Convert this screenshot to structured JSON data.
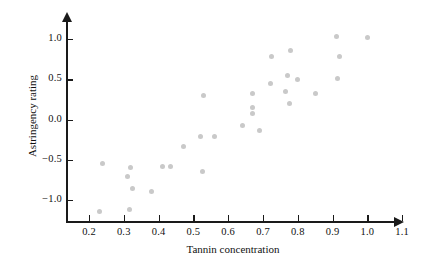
{
  "chart_data": {
    "type": "scatter",
    "title": "",
    "xlabel": "Tannin concentration",
    "ylabel": "Astringency rating",
    "xlim": [
      0.155,
      1.16
    ],
    "ylim": [
      -1.22,
      1.12
    ],
    "grid": false,
    "legend": null,
    "xticks": [
      0.2,
      0.3,
      0.4,
      0.5,
      0.6,
      0.7,
      0.8,
      0.9,
      1.0,
      1.1
    ],
    "xticklabels": [
      "0.2",
      "0.3",
      "0.4",
      "0.5",
      "0.6",
      "0.7",
      "0.8",
      "0.9",
      "1.0",
      "1.1"
    ],
    "yticks": [
      -1.0,
      -0.5,
      0.0,
      0.5,
      1.0
    ],
    "yticklabels": [
      "−1.0",
      "−0.5",
      "0.0",
      "0.5",
      "1.0"
    ],
    "marker": {
      "shape": "circle",
      "color": "#c9c9c9",
      "size": 5
    },
    "points": [
      {
        "x": 0.23,
        "y": -1.14
      },
      {
        "x": 0.24,
        "y": -0.55
      },
      {
        "x": 0.31,
        "y": -0.71
      },
      {
        "x": 0.315,
        "y": -1.12
      },
      {
        "x": 0.32,
        "y": -0.6
      },
      {
        "x": 0.325,
        "y": -0.86
      },
      {
        "x": 0.38,
        "y": -0.9
      },
      {
        "x": 0.41,
        "y": -0.58
      },
      {
        "x": 0.435,
        "y": -0.58
      },
      {
        "x": 0.47,
        "y": -0.33
      },
      {
        "x": 0.52,
        "y": -0.21
      },
      {
        "x": 0.525,
        "y": -0.64
      },
      {
        "x": 0.53,
        "y": 0.3
      },
      {
        "x": 0.56,
        "y": -0.21
      },
      {
        "x": 0.64,
        "y": -0.08
      },
      {
        "x": 0.67,
        "y": 0.33
      },
      {
        "x": 0.67,
        "y": 0.15
      },
      {
        "x": 0.67,
        "y": 0.08
      },
      {
        "x": 0.69,
        "y": -0.14
      },
      {
        "x": 0.72,
        "y": 0.45
      },
      {
        "x": 0.725,
        "y": 0.79
      },
      {
        "x": 0.765,
        "y": 0.35
      },
      {
        "x": 0.77,
        "y": 0.55
      },
      {
        "x": 0.775,
        "y": 0.2
      },
      {
        "x": 0.78,
        "y": 0.86
      },
      {
        "x": 0.8,
        "y": 0.5
      },
      {
        "x": 0.85,
        "y": 0.32
      },
      {
        "x": 0.91,
        "y": 1.03
      },
      {
        "x": 0.915,
        "y": 0.51
      },
      {
        "x": 0.92,
        "y": 0.79
      },
      {
        "x": 1.0,
        "y": 1.02
      }
    ]
  }
}
